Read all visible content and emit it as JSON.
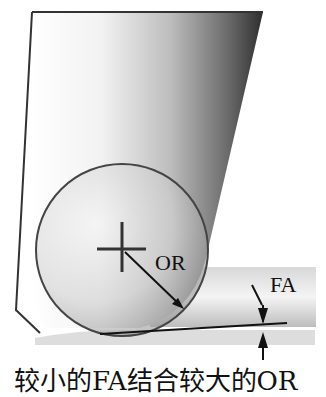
{
  "diagram": {
    "labels": {
      "corner_radius": "OR",
      "face_angle": "FA"
    },
    "caption": "较小的FA结合较大的OR",
    "colors": {
      "outline": "#333333",
      "background": "#ffffff",
      "text": "#111111"
    }
  }
}
